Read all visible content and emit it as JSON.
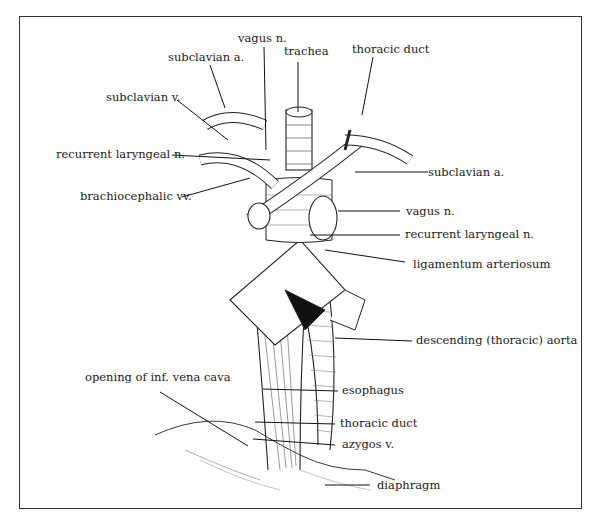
{
  "diagram": {
    "labels": {
      "vagus_top": "vagus n.",
      "trachea": "trachea",
      "subclavian_a_left": "subclavian a.",
      "thoracic_duct_top": "thoracic duct",
      "subclavian_v": "subclavian v.",
      "recurrent_laryngeal_left": "recurrent laryngeal n.",
      "brachiocephalic": "brachiocephalic vv.",
      "subclavian_a_right": "subclavian a.",
      "vagus_right": "vagus n.",
      "recurrent_laryngeal_right": "recurrent laryngeal n.",
      "ligamentum": "ligamentum arteriosum",
      "descending_aorta": "descending (thoracic) aorta",
      "ivc_opening": "opening of inf. vena cava",
      "esophagus": "esophagus",
      "thoracic_duct_bottom": "thoracic duct",
      "azygos": "azygos v.",
      "diaphragm": "diaphragm"
    }
  }
}
